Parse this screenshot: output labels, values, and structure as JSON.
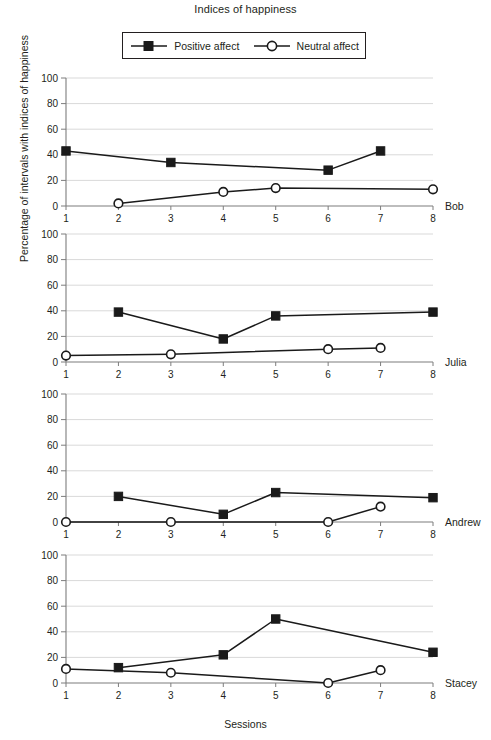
{
  "title": "Indices of happiness",
  "legend": {
    "items": [
      {
        "label": "Positive affect",
        "marker": "filled-square",
        "color": "#1a1a1a"
      },
      {
        "label": "Neutral affect",
        "marker": "open-circle",
        "color": "#1a1a1a"
      }
    ]
  },
  "axes": {
    "xlabel": "Sessions",
    "ylabel": "Percentage of intervals with indices of happiness",
    "yticks": [
      "0",
      "20",
      "40",
      "60",
      "80",
      "100"
    ],
    "xticks": [
      "1",
      "2",
      "3",
      "4",
      "5",
      "6",
      "7",
      "8"
    ]
  },
  "chart_data": {
    "type": "line",
    "title": "Indices of happiness",
    "xlabel": "Sessions",
    "ylabel": "Percentage of intervals with indices of happiness",
    "xlim": [
      1,
      8
    ],
    "ylim": [
      0,
      100
    ],
    "grid": true,
    "legend_position": "top-center",
    "x": [
      1,
      2,
      3,
      4,
      5,
      6,
      7,
      8
    ],
    "panels": [
      {
        "name": "Bob",
        "series": [
          {
            "name": "Positive affect",
            "marker": "filled-square",
            "x": [
              1,
              3,
              6,
              7
            ],
            "values": [
              43,
              34,
              28,
              43
            ]
          },
          {
            "name": "Neutral affect",
            "marker": "open-circle",
            "x": [
              2,
              4,
              5,
              8
            ],
            "values": [
              2,
              11,
              14,
              13
            ]
          }
        ]
      },
      {
        "name": "Julia",
        "series": [
          {
            "name": "Positive affect",
            "marker": "filled-square",
            "x": [
              2,
              4,
              5,
              8
            ],
            "values": [
              39,
              18,
              36,
              39
            ]
          },
          {
            "name": "Neutral affect",
            "marker": "open-circle",
            "x": [
              1,
              3,
              6,
              7
            ],
            "values": [
              5,
              6,
              10,
              11
            ]
          }
        ]
      },
      {
        "name": "Andrew",
        "series": [
          {
            "name": "Positive affect",
            "marker": "filled-square",
            "x": [
              2,
              4,
              5,
              8
            ],
            "values": [
              20,
              6,
              23,
              19
            ]
          },
          {
            "name": "Neutral affect",
            "marker": "open-circle",
            "x": [
              1,
              3,
              6,
              7
            ],
            "values": [
              0,
              0,
              0,
              12
            ]
          }
        ]
      },
      {
        "name": "Stacey",
        "series": [
          {
            "name": "Positive affect",
            "marker": "filled-square",
            "x": [
              2,
              4,
              5,
              8
            ],
            "values": [
              12,
              22,
              50,
              24
            ]
          },
          {
            "name": "Neutral affect",
            "marker": "open-circle",
            "x": [
              1,
              3,
              6,
              7
            ],
            "values": [
              11,
              8,
              0,
              10
            ]
          }
        ]
      }
    ]
  },
  "layout": {
    "panel_tops": [
      70,
      226,
      386,
      547
    ],
    "panel_height": 152,
    "plot_left": 66,
    "plot_right": 433,
    "plot_top": 8,
    "plot_bottom": 136
  }
}
